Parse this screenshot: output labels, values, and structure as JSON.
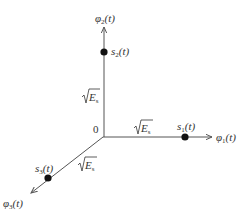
{
  "diagram": {
    "type": "signal-space-constellation-3d",
    "colors": {
      "axis": "#555555",
      "point": "#111111",
      "text": "#333333",
      "background": "#ffffff"
    },
    "origin_label": "0",
    "axes": [
      {
        "id": "phi1",
        "label": "φ",
        "subscript": "1",
        "suffix": "(t)",
        "direction": "right"
      },
      {
        "id": "phi2",
        "label": "φ",
        "subscript": "2",
        "suffix": "(t)",
        "direction": "up"
      },
      {
        "id": "phi3",
        "label": "φ",
        "subscript": "3",
        "suffix": "(t)",
        "direction": "down-left"
      }
    ],
    "points": [
      {
        "id": "s1",
        "label": "s",
        "subscript": "1",
        "suffix": "(t)",
        "axis": "phi1"
      },
      {
        "id": "s2",
        "label": "s",
        "subscript": "2",
        "suffix": "(t)",
        "axis": "phi2"
      },
      {
        "id": "s3",
        "label": "s",
        "subscript": "3",
        "suffix": "(t)",
        "axis": "phi3"
      }
    ],
    "distance_labels": [
      {
        "axis": "phi1",
        "radicand": "E",
        "subscript": "s"
      },
      {
        "axis": "phi2",
        "radicand": "E",
        "subscript": "s"
      },
      {
        "axis": "phi3",
        "radicand": "E",
        "subscript": "s"
      }
    ]
  }
}
